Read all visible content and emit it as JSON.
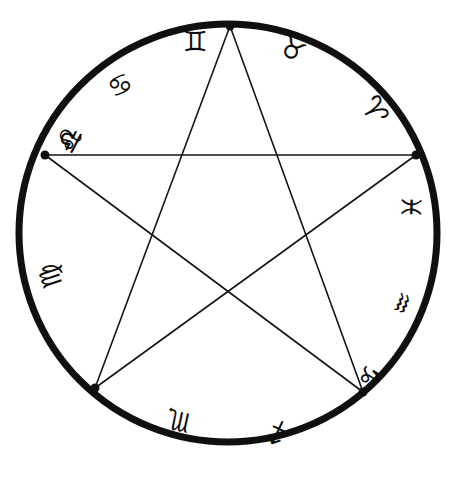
{
  "figure": {
    "name": "zodiac-pentagram-wheel",
    "background_color": "#ffffff",
    "ink_color": "#0d0d0d"
  },
  "circle": {
    "name": "zodiac-circle",
    "center_x": 228,
    "center_y": 233,
    "radius": 209,
    "stroke_width": 7,
    "stroke_color": "#101010"
  },
  "pentagram": {
    "name": "inscribed-pentagram",
    "stroke_width": 1.6,
    "stroke_color": "#151515",
    "vertex_dot_radius": 4.5,
    "vertices": [
      {
        "label": "top-apex",
        "x": 230,
        "y": 26
      },
      {
        "label": "right",
        "x": 416,
        "y": 155
      },
      {
        "label": "bottom-right",
        "x": 363,
        "y": 392
      },
      {
        "label": "bottom-left",
        "x": 95,
        "y": 388
      },
      {
        "label": "left",
        "x": 45,
        "y": 155
      }
    ],
    "edges": [
      [
        0,
        2
      ],
      [
        2,
        4
      ],
      [
        4,
        1
      ],
      [
        1,
        3
      ],
      [
        3,
        0
      ]
    ]
  },
  "zodiac_signs": [
    {
      "name": "aries",
      "glyph": "♈",
      "label": "Aries",
      "x": 374,
      "y": 110,
      "rotation": 62,
      "size": 30
    },
    {
      "name": "taurus",
      "glyph": "♉",
      "label": "Taurus",
      "x": 292,
      "y": 50,
      "rotation": 30,
      "size": 28
    },
    {
      "name": "gemini",
      "glyph": "♊",
      "label": "Gemini",
      "x": 195,
      "y": 42,
      "rotation": 0,
      "size": 28
    },
    {
      "name": "cancer",
      "glyph": "♋",
      "label": "Cancer",
      "x": 120,
      "y": 85,
      "rotation": -28,
      "size": 27
    },
    {
      "name": "leo",
      "glyph": "♌",
      "label": "Leo",
      "x": 70,
      "y": 140,
      "rotation": -62,
      "size": 29
    },
    {
      "name": "virgo",
      "glyph": "♍",
      "label": "Virgo",
      "x": 50,
      "y": 276,
      "rotation": -108,
      "size": 27
    },
    {
      "name": "libra",
      "glyph": "♎",
      "label": "Libra",
      "x": 0,
      "y": 0,
      "rotation": 0,
      "size": 0
    },
    {
      "name": "scorpio",
      "glyph": "♏",
      "label": "Scorpio",
      "x": 178,
      "y": 421,
      "rotation": -168,
      "size": 27
    },
    {
      "name": "sagittarius",
      "glyph": "♐",
      "label": "Sagittarius",
      "x": 277,
      "y": 432,
      "rotation": 160,
      "size": 26
    },
    {
      "name": "capricorn",
      "glyph": "♑",
      "label": "Capricorn",
      "x": 370,
      "y": 375,
      "rotation": 130,
      "size": 28
    },
    {
      "name": "aquarius",
      "glyph": "♒",
      "label": "Aquarius",
      "x": 402,
      "y": 303,
      "rotation": 112,
      "size": 26
    },
    {
      "name": "pisces",
      "glyph": "♓",
      "label": "Pisces",
      "x": 411,
      "y": 207,
      "rotation": 92,
      "size": 27
    }
  ],
  "libra_override": {
    "name": "libra",
    "glyph": "♎",
    "label": "Libra",
    "x": 70,
    "y": 140,
    "rotation": -62,
    "size": 29
  }
}
